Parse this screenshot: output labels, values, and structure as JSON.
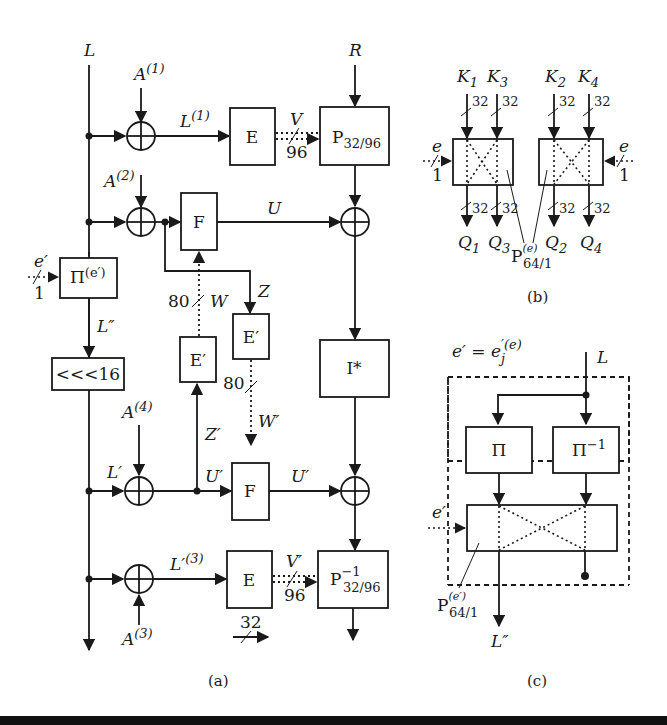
{
  "figure": {
    "panel_a": {
      "caption": "(a)",
      "inputs": {
        "left": "L",
        "right": "R"
      },
      "constants": {
        "a1": "A",
        "a1_sup": "(1)",
        "a2": "A",
        "a2_sup": "(2)",
        "a3": "A",
        "a3_sup": "(3)",
        "a4": "A",
        "a4_sup": "(4)"
      },
      "signals": {
        "l1": "L",
        "l1_sup": "(1)",
        "v": "V",
        "v_width": "96",
        "u": "U",
        "z": "Z",
        "w": "W",
        "w_width": "80",
        "l_dprime": "L″",
        "l_prime": "L′",
        "u_prime_in": "U′",
        "u_prime_out": "U′",
        "z_prime": "Z′",
        "w_prime": "W′",
        "w_prime_width": "80",
        "l3": "L′",
        "l3_sup": "(3)",
        "v_prime": "V′",
        "v_prime_width": "96",
        "e_prime": "e′",
        "e_prime_width": "1",
        "bus_legend": "32"
      },
      "blocks": {
        "e_top": "E",
        "p_top": "P",
        "p_top_sub": "32/96",
        "f_top": "F",
        "pi": "Π",
        "pi_sup": "(e′)",
        "rot": "<<<16",
        "e_prime_left": "E′",
        "e_prime_right": "E′",
        "i_star": "I*",
        "f_bottom": "F",
        "e_bottom": "E",
        "p_bottom": "P",
        "p_bottom_sup": "−1",
        "p_bottom_sub": "32/96"
      }
    },
    "panel_b": {
      "caption": "(b)",
      "keys": [
        {
          "name": "K",
          "sub": "1",
          "width": "32"
        },
        {
          "name": "K",
          "sub": "3",
          "width": "32"
        },
        {
          "name": "K",
          "sub": "2",
          "width": "32"
        },
        {
          "name": "K",
          "sub": "4",
          "width": "32"
        }
      ],
      "outputs": [
        {
          "name": "Q",
          "sub": "1",
          "width": "32"
        },
        {
          "name": "Q",
          "sub": "3",
          "width": "32"
        },
        {
          "name": "Q",
          "sub": "2",
          "width": "32"
        },
        {
          "name": "Q",
          "sub": "4",
          "width": "32"
        }
      ],
      "control": {
        "name": "e",
        "width": "1"
      },
      "block": {
        "name": "P",
        "sup": "(e)",
        "sub": "64/1"
      }
    },
    "panel_c": {
      "caption": "(c)",
      "equation": {
        "lhs": "e′ = e",
        "sub": "j",
        "sup": "′(e)"
      },
      "input": "L",
      "output": "L″",
      "control": "e′",
      "blocks": {
        "pi": "Π",
        "pi_inv": "Π",
        "pi_inv_sup": "−1"
      },
      "switch": {
        "name": "P",
        "sup": "(e′)",
        "sub": "64/1"
      }
    }
  }
}
